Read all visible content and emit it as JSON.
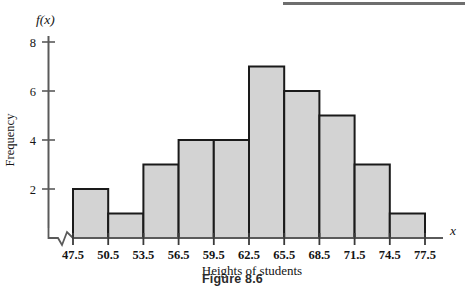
{
  "figure": {
    "caption": "Figure 8.6",
    "y_axis_symbol": "f(x)",
    "x_axis_symbol": "x",
    "y_axis_title": "Frequency",
    "x_axis_title": "Heights of students",
    "axis_break_present": true,
    "bar_fill_color": "#d3d3d3",
    "bar_stroke_color": "#1a1a1a",
    "axis_color": "#5a5a5a"
  },
  "chart_data": {
    "type": "bar",
    "title": "Figure 8.6",
    "xlabel": "Heights of students",
    "ylabel": "Frequency",
    "categories": [
      "47.5-50.5",
      "50.5-53.5",
      "53.5-56.5",
      "56.5-59.5",
      "59.5-62.5",
      "62.5-65.5",
      "65.5-68.5",
      "68.5-71.5",
      "71.5-74.5",
      "74.5-77.5"
    ],
    "bin_edges": [
      47.5,
      50.5,
      53.5,
      56.5,
      59.5,
      62.5,
      65.5,
      68.5,
      71.5,
      74.5,
      77.5
    ],
    "values": [
      2,
      1,
      3,
      4,
      4,
      7,
      6,
      5,
      3,
      1
    ],
    "xtick_labels": [
      "47.5",
      "50.5",
      "53.5",
      "56.5",
      "59.5",
      "62.5",
      "65.5",
      "68.5",
      "71.5",
      "74.5",
      "77.5"
    ],
    "ytick_labels": [
      "2",
      "4",
      "6",
      "8"
    ],
    "ytick_values": [
      2,
      4,
      6,
      8
    ],
    "ylim": [
      0,
      9
    ],
    "xlim": [
      47.5,
      77.5
    ],
    "grid": false,
    "legend": false,
    "total_frequency": 36
  }
}
